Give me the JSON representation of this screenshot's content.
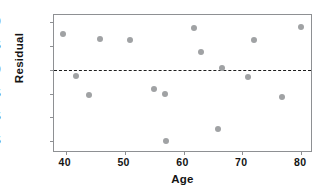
{
  "chart_data": {
    "type": "scatter",
    "title": "",
    "xlabel": "Age",
    "ylabel": "Residual",
    "xlim": [
      38,
      82
    ],
    "ylim": [
      -17.5,
      11.5
    ],
    "grid": false,
    "legend": null,
    "xticks": [
      "40",
      "50",
      "60",
      "70",
      "80"
    ],
    "xtick_values": [
      40,
      50,
      60,
      70,
      80
    ],
    "yticks": [
      "10",
      "5",
      "0",
      "-5",
      "-15",
      "-15"
    ],
    "ytick_values": [
      10,
      5,
      0,
      -5,
      -10,
      -15
    ],
    "reference_line": {
      "axis": "y",
      "value": 0,
      "style": "dashed",
      "color": "#1d1d1d"
    },
    "point_color": "#a0a2a4",
    "points": [
      {
        "x": 39.6,
        "y": 7.6
      },
      {
        "x": 41.8,
        "y": -1.4
      },
      {
        "x": 44.0,
        "y": -5.4
      },
      {
        "x": 45.8,
        "y": 6.4
      },
      {
        "x": 50.9,
        "y": 6.2
      },
      {
        "x": 55.0,
        "y": -4.0
      },
      {
        "x": 56.9,
        "y": -5.0
      },
      {
        "x": 57.0,
        "y": -15.0
      },
      {
        "x": 61.7,
        "y": 8.7
      },
      {
        "x": 62.9,
        "y": 3.8
      },
      {
        "x": 65.9,
        "y": -12.4
      },
      {
        "x": 66.5,
        "y": 0.3
      },
      {
        "x": 70.9,
        "y": -1.6
      },
      {
        "x": 71.9,
        "y": 6.3
      },
      {
        "x": 76.8,
        "y": -5.8
      },
      {
        "x": 80.0,
        "y": 9.0
      }
    ]
  }
}
